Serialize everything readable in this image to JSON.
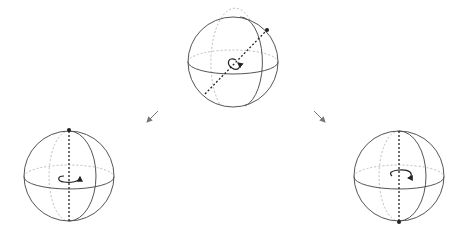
{
  "diagram": {
    "colors": {
      "outline": "#555555",
      "hidden": "#bbbbbb",
      "axis": "#222222",
      "arrow": "#777777"
    },
    "spheres": [
      {
        "id": "top",
        "cx": 233,
        "cy": 62,
        "r": 45,
        "axis": "tilted",
        "pole": "upper-right"
      },
      {
        "id": "left",
        "cx": 69,
        "cy": 176,
        "r": 45,
        "axis": "vertical",
        "pole": "top"
      },
      {
        "id": "right",
        "cx": 399,
        "cy": 176,
        "r": 45,
        "axis": "vertical",
        "pole": "bottom"
      }
    ],
    "arrows": [
      {
        "id": "to-left",
        "direction": "down-left"
      },
      {
        "id": "to-right",
        "direction": "down-right"
      }
    ]
  }
}
